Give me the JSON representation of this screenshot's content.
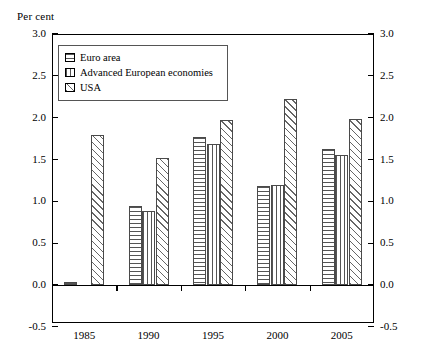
{
  "axis_unit_label": "Per cent",
  "legend": {
    "items": [
      {
        "label": "Euro area",
        "pattern": "horizontal-lines"
      },
      {
        "label": "Advanced European economies",
        "pattern": "vertical-lines"
      },
      {
        "label": "USA",
        "pattern": "diagonal-hatch"
      }
    ]
  },
  "y_ticks": [
    "3.0",
    "2.5",
    "2.0",
    "1.5",
    "1.0",
    "0.5",
    "0.0",
    "-0.5"
  ],
  "chart_data": {
    "type": "bar",
    "title": "",
    "subtitle": "",
    "xlabel": "",
    "ylabel": "Per cent",
    "categories": [
      "1985",
      "1990",
      "1995",
      "2000",
      "2005"
    ],
    "series": [
      {
        "name": "Euro area",
        "pattern": "horizontal-lines",
        "values": [
          0.04,
          0.94,
          1.77,
          1.18,
          1.63
        ]
      },
      {
        "name": "Advanced European economies",
        "pattern": "vertical-lines",
        "values": [
          null,
          0.88,
          1.68,
          1.2,
          1.55
        ]
      },
      {
        "name": "USA",
        "pattern": "diagonal-hatch",
        "values": [
          1.79,
          1.52,
          1.97,
          2.22,
          1.99
        ]
      }
    ],
    "ylim": [
      -0.5,
      3.0
    ],
    "ytick_step": 0.5,
    "ytick_labels": [
      "3.0",
      "2.5",
      "2.0",
      "1.5",
      "1.0",
      "0.5",
      "0.0",
      "-0.5"
    ],
    "xtick_labels": [
      "1985",
      "1990",
      "1995",
      "2000",
      "2005"
    ],
    "grid": false,
    "legend_position": "inside-top-left",
    "dual_y_axis": true,
    "zero_baseline": true
  }
}
